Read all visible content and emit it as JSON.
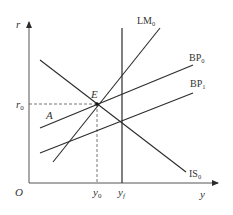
{
  "diagram": {
    "axes": {
      "y_axis_label": "r",
      "x_axis_label": "y",
      "origin_label": "O"
    },
    "curves": [
      {
        "id": "IS",
        "label_main": "IS",
        "label_sub": "0",
        "slope": "negative"
      },
      {
        "id": "LM",
        "label_main": "LM",
        "label_sub": "0",
        "slope": "positive"
      },
      {
        "id": "BP0",
        "label_main": "BP",
        "label_sub": "0",
        "slope": "positive"
      },
      {
        "id": "BP1",
        "label_main": "BP",
        "label_sub": "1",
        "slope": "positive"
      },
      {
        "id": "YF",
        "label_main": "y",
        "label_sub": "f",
        "slope": "vertical"
      }
    ],
    "points": {
      "equilibrium_label": "E",
      "point_a_label": "A"
    },
    "ticks": {
      "r0_main": "r",
      "r0_sub": "0",
      "y0_main": "y",
      "y0_sub": "0",
      "yf_main": "y",
      "yf_sub": "f"
    },
    "colors": {
      "line": "#2b2b2b",
      "dashed": "#555555",
      "text": "#333333"
    }
  }
}
